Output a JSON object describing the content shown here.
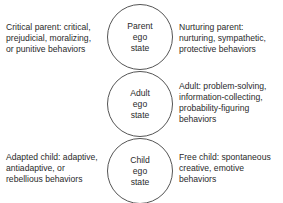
{
  "ego_states": [
    {
      "line1": "Parent",
      "line2": "ego",
      "line3": "state"
    },
    {
      "line1": "Adult",
      "line2": "ego",
      "line3": "state"
    },
    {
      "line1": "Child",
      "line2": "ego",
      "line3": "state"
    }
  ],
  "descriptions": {
    "critical_parent": [
      "Critical parent:  critical,",
      "prejudicial, moralizing,",
      "or punitive behaviors"
    ],
    "nurturing_parent": [
      "Nurturing parent:",
      "nurturing, sympathetic,",
      "protective behaviors"
    ],
    "adult": [
      "Adult:  problem-solving,",
      "information-collecting,",
      "probability-figuring",
      "behaviors"
    ],
    "adapted_child": [
      "Adapted child:  adaptive,",
      "antiadaptive, or",
      "rebellious behaviors"
    ],
    "free_child": [
      "Free child:  spontaneous",
      "creative, emotive",
      "behaviors"
    ]
  }
}
